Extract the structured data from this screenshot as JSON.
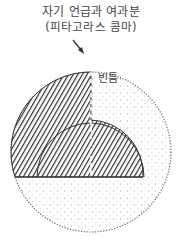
{
  "caption": {
    "line1": "자기 언급과 여과분",
    "line2": "(피타고라스 콤마)"
  },
  "regions": {
    "gap_label": "빈틈"
  },
  "icons": {
    "arrow": "arrow-down-right"
  },
  "colors": {
    "hatch": "#333333",
    "dots": "#777777",
    "text": "#444444"
  }
}
